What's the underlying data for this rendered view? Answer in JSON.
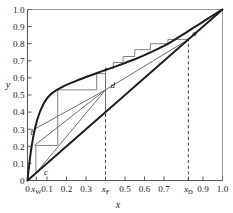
{
  "chart_data": {
    "type": "line",
    "title": "",
    "xlabel": "x",
    "ylabel": "y",
    "xlim": [
      0,
      1
    ],
    "ylim": [
      0,
      1
    ],
    "grid": false,
    "legend": null,
    "xtick_labels": [
      "0",
      "xW",
      "0.1",
      "0.2",
      "0.3",
      "xF",
      "0.5",
      "0.6",
      "0.7",
      "xD",
      "0.9",
      "1.0"
    ],
    "xtick_values": [
      0,
      0.045,
      0.1,
      0.2,
      0.3,
      0.4,
      0.5,
      0.6,
      0.7,
      0.825,
      0.9,
      1.0
    ],
    "ytick_labels": [
      "0",
      "0.1",
      "0.2",
      "0.3",
      "0.4",
      "0.5",
      "0.6",
      "0.7",
      "0.8",
      "0.9",
      "1.0"
    ],
    "ytick_values": [
      0,
      0.1,
      0.2,
      0.3,
      0.4,
      0.5,
      0.6,
      0.7,
      0.8,
      0.9,
      1.0
    ],
    "series": [
      {
        "name": "equilibrium-curve",
        "points": [
          [
            0,
            0
          ],
          [
            0.005,
            0.055
          ],
          [
            0.01,
            0.105
          ],
          [
            0.015,
            0.15
          ],
          [
            0.02,
            0.19
          ],
          [
            0.03,
            0.258
          ],
          [
            0.04,
            0.312
          ],
          [
            0.05,
            0.355
          ],
          [
            0.065,
            0.405
          ],
          [
            0.08,
            0.443
          ],
          [
            0.1,
            0.48
          ],
          [
            0.12,
            0.505
          ],
          [
            0.14,
            0.522
          ],
          [
            0.16,
            0.536
          ],
          [
            0.2,
            0.559
          ],
          [
            0.25,
            0.583
          ],
          [
            0.3,
            0.605
          ],
          [
            0.35,
            0.626
          ],
          [
            0.4,
            0.646
          ],
          [
            0.45,
            0.666
          ],
          [
            0.5,
            0.687
          ],
          [
            0.55,
            0.709
          ],
          [
            0.6,
            0.733
          ],
          [
            0.65,
            0.759
          ],
          [
            0.7,
            0.787
          ],
          [
            0.75,
            0.82
          ],
          [
            0.8,
            0.856
          ],
          [
            0.85,
            0.893
          ],
          [
            0.9,
            0.928
          ],
          [
            0.95,
            0.965
          ],
          [
            1.0,
            1.0
          ]
        ]
      },
      {
        "name": "diagonal-45",
        "points": [
          [
            0,
            0
          ],
          [
            1,
            1
          ]
        ]
      },
      {
        "name": "rectifying-operating-line",
        "points": [
          [
            0.825,
            0.825
          ],
          [
            0.4,
            0.53
          ]
        ]
      },
      {
        "name": "stripping-operating-line",
        "points": [
          [
            0.045,
            0.045
          ],
          [
            0.4,
            0.53
          ]
        ]
      },
      {
        "name": "feed-q-line",
        "points": [
          [
            0.4,
            0.4
          ],
          [
            0.4,
            0.66
          ]
        ]
      },
      {
        "name": "secondary-operating-line",
        "points": [
          [
            0.035,
            0.3
          ],
          [
            0.4,
            0.53
          ]
        ]
      },
      {
        "name": "lower-chord-line",
        "points": [
          [
            0.035,
            0.205
          ],
          [
            0.4,
            0.53
          ]
        ]
      }
    ],
    "annotations": [
      {
        "label": "a",
        "x": 0.845,
        "y": 0.835
      },
      {
        "label": "b",
        "x": 0.015,
        "y": 0.255
      },
      {
        "label": "c",
        "x": 0.085,
        "y": 0.025
      },
      {
        "label": "d",
        "x": 0.425,
        "y": 0.53
      }
    ],
    "vertical_dashed_lines": [
      {
        "name": "feed-line",
        "x": 0.4,
        "y_top": 0.66
      },
      {
        "name": "distillate-line",
        "x": 0.825,
        "y_top": 0.835
      }
    ],
    "staircase_steps": {
      "name": "mccabe-thiele-stages",
      "vertices": [
        [
          0.825,
          0.825
        ],
        [
          0.72,
          0.825
        ],
        [
          0.72,
          0.8
        ],
        [
          0.63,
          0.8
        ],
        [
          0.63,
          0.765
        ],
        [
          0.55,
          0.765
        ],
        [
          0.55,
          0.725
        ],
        [
          0.49,
          0.725
        ],
        [
          0.49,
          0.69
        ],
        [
          0.44,
          0.69
        ],
        [
          0.44,
          0.655
        ],
        [
          0.4,
          0.655
        ],
        [
          0.4,
          0.625
        ],
        [
          0.355,
          0.625
        ],
        [
          0.355,
          0.53
        ],
        [
          0.155,
          0.53
        ],
        [
          0.155,
          0.205
        ],
        [
          0.043,
          0.205
        ],
        [
          0.043,
          0.045
        ]
      ]
    },
    "colors": {
      "equilibrium_curve": "#1c1c1c",
      "diagonal": "#1c1c1c",
      "operating_lines": "#6e6e6e",
      "staircase": "#7a7a7a",
      "dashed": "#444444",
      "axis": "#5a5a5a",
      "text": "#1a1a1a",
      "background": "#ffffff"
    }
  }
}
